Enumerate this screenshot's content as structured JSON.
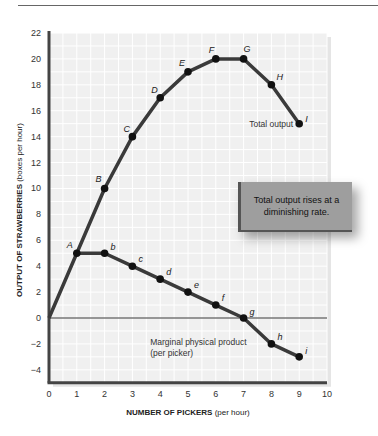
{
  "chart_data": {
    "type": "line",
    "title": "",
    "xlabel_bold": "NUMBER OF PICKERS",
    "xlabel_unit": "(per hour)",
    "ylabel_bold": "OUTPUT OF STRAWBERRIES",
    "ylabel_unit": "(boxes per hour)",
    "xlim": [
      0,
      10
    ],
    "ylim": [
      -5,
      22
    ],
    "x_ticks": [
      0,
      1,
      2,
      3,
      4,
      5,
      6,
      7,
      8,
      9,
      10
    ],
    "y_ticks": [
      22,
      20,
      18,
      16,
      14,
      12,
      10,
      8,
      6,
      4,
      2,
      0,
      -2,
      -4
    ],
    "grid": true,
    "series": [
      {
        "name": "Total output",
        "x": [
          0,
          1,
          2,
          3,
          4,
          5,
          6,
          7,
          8,
          9
        ],
        "values": [
          0,
          5,
          10,
          14,
          17,
          19,
          20,
          20,
          18,
          15
        ],
        "point_labels": [
          "",
          "A",
          "B",
          "C",
          "D",
          "E",
          "F",
          "G",
          "H",
          "I"
        ]
      },
      {
        "name": "Marginal physical product (per picker)",
        "x": [
          1,
          2,
          3,
          4,
          5,
          6,
          7,
          8,
          9
        ],
        "values": [
          5,
          5,
          4,
          3,
          2,
          1,
          0,
          -2,
          -3
        ],
        "point_labels": [
          "A",
          "b",
          "c",
          "d",
          "e",
          "f",
          "g",
          "h",
          "i"
        ]
      }
    ],
    "annotations": [
      {
        "text": "Total output",
        "near": "I"
      },
      {
        "text": "Marginal physical product",
        "line2": "(per picker)"
      },
      {
        "text": "Total output rises at a diminishing rate."
      }
    ]
  },
  "labels": {
    "total_output": "Total output",
    "mpp_line1": "Marginal physical product",
    "mpp_line2": "(per picker)",
    "note": "Total output rises at a diminishing rate.",
    "xlabel_bold": "NUMBER OF PICKERS",
    "xlabel_unit": " (per hour)",
    "ylabel_bold": "OUTPUT OF STRAWBERRIES",
    "ylabel_unit": " (boxes per hour)"
  },
  "colors": {
    "line": "#3a3a3a",
    "plot_bg": "#f0f0f0",
    "grid": "#ffffff",
    "note_bg": "#9e9e9e"
  }
}
